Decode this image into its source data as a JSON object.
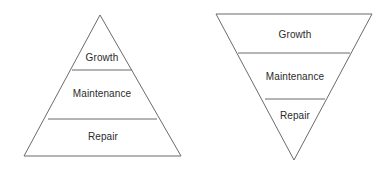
{
  "diagram": {
    "background_color": "#ffffff",
    "line_color": "#6b6b6b",
    "text_color": "#2b2b2b",
    "line_width": 1,
    "shapes": [
      {
        "name": "upright-pyramid",
        "orientation": "upright",
        "outline": "24,156 181,156 100,15",
        "dividers": [
          {
            "name": "divider-growth-maintenance",
            "x1": 72,
            "y1": 70,
            "x2": 132,
            "y2": 70
          },
          {
            "name": "divider-maintenance-repair",
            "x1": 48,
            "y1": 119,
            "x2": 157,
            "y2": 119
          }
        ],
        "tiers": [
          {
            "label": "Growth",
            "cx": 102,
            "cy": 58
          },
          {
            "label": "Maintenance",
            "cx": 102,
            "cy": 94
          },
          {
            "label": "Repair",
            "cx": 103,
            "cy": 137
          }
        ]
      },
      {
        "name": "inverted-pyramid",
        "orientation": "inverted",
        "outline": "216,14 372,14 294,160",
        "dividers": [
          {
            "name": "divider-growth-maintenance",
            "x1": 238,
            "y1": 53,
            "x2": 350,
            "y2": 53
          },
          {
            "name": "divider-maintenance-repair",
            "x1": 265,
            "y1": 99,
            "x2": 325,
            "y2": 99
          }
        ],
        "tiers": [
          {
            "label": "Growth",
            "cx": 295,
            "cy": 35
          },
          {
            "label": "Maintenance",
            "cx": 295,
            "cy": 77
          },
          {
            "label": "Repair",
            "cx": 295,
            "cy": 116
          }
        ]
      }
    ]
  }
}
